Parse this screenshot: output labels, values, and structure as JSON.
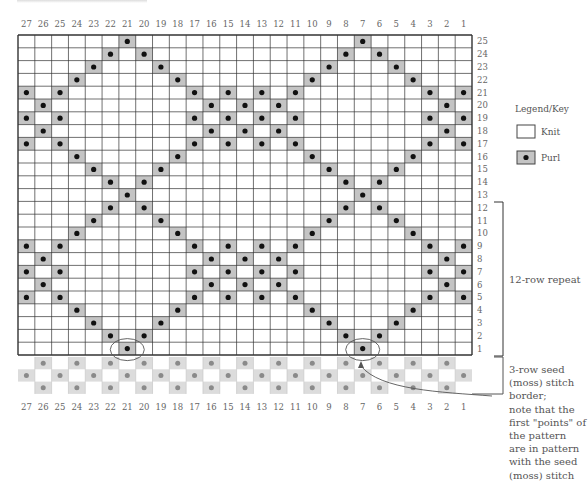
{
  "chart_data": {
    "type": "knitting-chart",
    "columns": 27,
    "rows": 25,
    "column_labels": [
      "27",
      "26",
      "25",
      "24",
      "23",
      "22",
      "21",
      "20",
      "19",
      "18",
      "17",
      "16",
      "15",
      "14",
      "13",
      "12",
      "11",
      "10",
      "9",
      "8",
      "7",
      "6",
      "5",
      "4",
      "3",
      "2",
      "1"
    ],
    "row_labels": [
      "25",
      "24",
      "23",
      "22",
      "21",
      "20",
      "19",
      "18",
      "17",
      "16",
      "15",
      "14",
      "13",
      "12",
      "11",
      "10",
      "9",
      "8",
      "7",
      "6",
      "5",
      "4",
      "3",
      "2",
      "1"
    ],
    "purl_cells_by_row": {
      "25": [
        21,
        7
      ],
      "24": [
        22,
        20,
        8,
        6
      ],
      "23": [
        23,
        19,
        9,
        5
      ],
      "22": [
        24,
        18,
        10,
        4
      ],
      "21": [
        27,
        25,
        17,
        15,
        13,
        11,
        3,
        1
      ],
      "20": [
        26,
        16,
        14,
        12,
        2
      ],
      "19": [
        27,
        25,
        17,
        15,
        13,
        11,
        3,
        1
      ],
      "18": [
        26,
        16,
        14,
        12,
        2
      ],
      "17": [
        27,
        25,
        17,
        15,
        13,
        11,
        3,
        1
      ],
      "16": [
        24,
        18,
        10,
        4
      ],
      "15": [
        23,
        19,
        9,
        5
      ],
      "14": [
        22,
        20,
        8,
        6
      ],
      "13": [
        21,
        7
      ],
      "12": [
        22,
        20,
        8,
        6
      ],
      "11": [
        23,
        19,
        9,
        5
      ],
      "10": [
        24,
        18,
        10,
        4
      ],
      "9": [
        27,
        25,
        17,
        15,
        13,
        11,
        3,
        1
      ],
      "8": [
        26,
        16,
        14,
        12,
        2
      ],
      "7": [
        27,
        25,
        17,
        15,
        13,
        11,
        3,
        1
      ],
      "6": [
        26,
        16,
        14,
        12,
        2
      ],
      "5": [
        27,
        25,
        17,
        15,
        13,
        11,
        3,
        1
      ],
      "4": [
        24,
        18,
        10,
        4
      ],
      "3": [
        23,
        19,
        9,
        5
      ],
      "2": [
        22,
        20,
        8,
        6
      ],
      "1": [
        21,
        7
      ]
    },
    "seed_border_rows": [
      {
        "purl_cols": [
          26,
          24,
          22,
          20,
          18,
          16,
          14,
          12,
          10,
          8,
          6,
          4,
          2
        ]
      },
      {
        "purl_cols": [
          27,
          25,
          23,
          21,
          19,
          17,
          15,
          13,
          11,
          9,
          7,
          5,
          3,
          1
        ]
      },
      {
        "purl_cols": [
          26,
          24,
          22,
          20,
          18,
          16,
          14,
          12,
          10,
          8,
          6,
          4,
          2
        ]
      }
    ],
    "circled_cells": [
      {
        "row": 1,
        "col": 21
      },
      {
        "row": 1,
        "col": 7
      }
    ]
  },
  "legend": {
    "title": "Legend/Key",
    "items": [
      {
        "label": "Knit",
        "symbol": "empty-square"
      },
      {
        "label": "Purl",
        "symbol": "dot-square"
      }
    ]
  },
  "annotations": {
    "repeat_label": "12-row repeat",
    "border_note_lines": [
      "3-row seed",
      "(moss) stitch",
      "border;",
      "note that the",
      "first \"points\" of",
      "the pattern",
      "are in pattern",
      "with the seed",
      "(moss) stitch"
    ]
  },
  "colors": {
    "grid_line": "#333333",
    "purl_fill": "#c4c4c4",
    "purl_dot": "#111111",
    "border_fill": "#dcdcdc",
    "border_dot": "#8a8a8a",
    "border_line": "#c8c8c8",
    "annotation_line": "#555555"
  }
}
